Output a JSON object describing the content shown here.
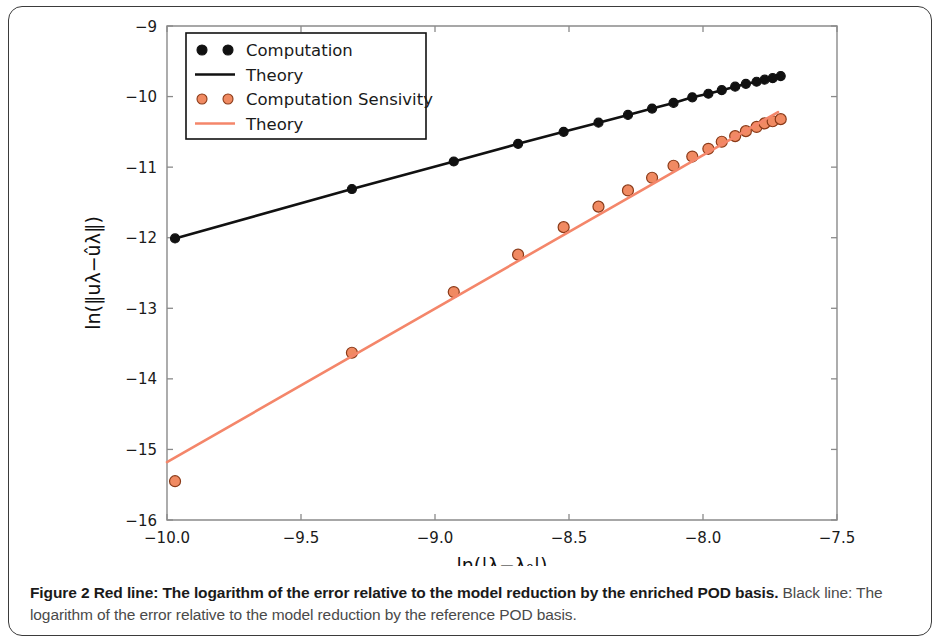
{
  "figure": {
    "caption_bold": "Figure 2 Red line: The logarithm of the error relative to the model reduction by the enriched POD basis.",
    "caption_rest": " Black line: The logarithm of the error relative to the model reduction by the reference POD basis."
  },
  "legend": {
    "items": [
      {
        "label": "Computation",
        "type": "marker",
        "color": "#111111",
        "edge": "#111111"
      },
      {
        "label": "Theory",
        "type": "line",
        "color": "#111111"
      },
      {
        "label": "Computation Sensivity",
        "type": "marker",
        "color": "#f08a62",
        "edge": "#8a3a18"
      },
      {
        "label": "Theory",
        "type": "line",
        "color": "#f4866a"
      }
    ]
  },
  "chart_data": {
    "type": "scatter",
    "title": "",
    "xlabel": "ln(|λ−λ₀|)",
    "ylabel": "ln(‖uλ−ûλ‖)",
    "xlim": [
      -10.0,
      -7.5
    ],
    "ylim": [
      -16,
      -9
    ],
    "xticks": [
      -10.0,
      -9.5,
      -9.0,
      -8.5,
      -8.0,
      -7.5
    ],
    "xticklabels": [
      "−10.0",
      "−9.5",
      "−9.0",
      "−8.5",
      "−8.0",
      "−7.5"
    ],
    "yticks": [
      -9,
      -10,
      -11,
      -12,
      -13,
      -14,
      -15,
      -16
    ],
    "yticklabels": [
      "−9",
      "−10",
      "−11",
      "−12",
      "−13",
      "−14",
      "−15",
      "−16"
    ],
    "grid": false,
    "legend_position": "upper left",
    "series": [
      {
        "name": "Computation",
        "kind": "scatter",
        "color": "#111111",
        "edge": "#111111",
        "marker_size": 9,
        "x": [
          -9.97,
          -9.31,
          -8.93,
          -8.69,
          -8.52,
          -8.39,
          -8.28,
          -8.19,
          -8.11,
          -8.04,
          -7.98,
          -7.93,
          -7.88,
          -7.84,
          -7.8,
          -7.77,
          -7.74,
          -7.71
        ],
        "y": [
          -12.01,
          -11.31,
          -10.92,
          -10.67,
          -10.5,
          -10.37,
          -10.26,
          -10.17,
          -10.09,
          -10.01,
          -9.96,
          -9.91,
          -9.86,
          -9.82,
          -9.79,
          -9.76,
          -9.74,
          -9.71
        ]
      },
      {
        "name": "Theory",
        "kind": "line",
        "color": "#111111",
        "x": [
          -9.97,
          -9.31,
          -8.93,
          -8.69,
          -8.52,
          -8.39,
          -8.28,
          -8.19,
          -8.11,
          -8.04,
          -7.98,
          -7.93,
          -7.88,
          -7.84,
          -7.8,
          -7.77,
          -7.74,
          -7.71
        ],
        "y": [
          -12.01,
          -11.31,
          -10.92,
          -10.67,
          -10.5,
          -10.37,
          -10.26,
          -10.17,
          -10.09,
          -10.01,
          -9.96,
          -9.91,
          -9.86,
          -9.82,
          -9.79,
          -9.76,
          -9.74,
          -9.71
        ]
      },
      {
        "name": "Computation Sensivity",
        "kind": "scatter",
        "color": "#f08a62",
        "edge": "#8a3a18",
        "marker_size": 11,
        "x": [
          -9.97,
          -9.31,
          -8.93,
          -8.69,
          -8.52,
          -8.39,
          -8.28,
          -8.19,
          -8.11,
          -8.04,
          -7.98,
          -7.93,
          -7.88,
          -7.84,
          -7.8,
          -7.77,
          -7.74,
          -7.71
        ],
        "y": [
          -15.45,
          -13.63,
          -12.77,
          -12.24,
          -11.85,
          -11.56,
          -11.33,
          -11.15,
          -10.98,
          -10.85,
          -10.74,
          -10.64,
          -10.56,
          -10.49,
          -10.43,
          -10.38,
          -10.35,
          -10.32
        ]
      },
      {
        "name": "Theory",
        "kind": "line",
        "color": "#f4866a",
        "x": [
          -10.0,
          -7.72
        ],
        "y": [
          -15.18,
          -10.22
        ]
      }
    ]
  }
}
